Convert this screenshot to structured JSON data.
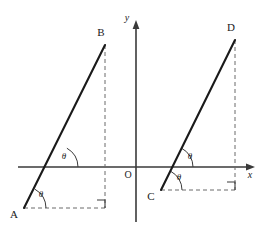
{
  "figure": {
    "kind": "geometry-diagram",
    "background_color": "#ffffff",
    "stroke_color": "#1a1a1a",
    "axis_color": "#3a3a3a",
    "dash_color": "#6b6b6b",
    "axes": {
      "x_axis_label": "x",
      "y_axis_label": "y",
      "origin_label": "O",
      "x_axis_y": 167,
      "y_axis_x": 136,
      "x_axis_start": 18,
      "x_axis_end": 255,
      "y_axis_top": 20,
      "y_axis_bottom": 222
    },
    "points": [
      {
        "label": "A",
        "x": 24,
        "y": 208,
        "label_x": 14,
        "label_y": 218
      },
      {
        "label": "B",
        "x": 105,
        "y": 45,
        "label_x": 101,
        "label_y": 36
      },
      {
        "label": "C",
        "x": 161,
        "y": 190,
        "label_x": 151,
        "label_y": 200
      },
      {
        "label": "D",
        "x": 235,
        "y": 40,
        "label_x": 231,
        "label_y": 31
      }
    ],
    "segments": [
      {
        "name": "segment-AB",
        "from": "A",
        "to": "B",
        "x1": 24,
        "y1": 208,
        "x2": 105,
        "y2": 45
      },
      {
        "name": "segment-CD",
        "from": "C",
        "to": "D",
        "x1": 161,
        "y1": 190,
        "x2": 235,
        "y2": 40
      }
    ],
    "dashed_lines": [
      {
        "name": "dashed-horizontal-A",
        "x1": 24,
        "y1": 208,
        "x2": 105,
        "y2": 208
      },
      {
        "name": "dashed-vertical-B",
        "x1": 105,
        "y1": 45,
        "x2": 105,
        "y2": 208
      },
      {
        "name": "dashed-horizontal-C",
        "x1": 161,
        "y1": 190,
        "x2": 235,
        "y2": 190
      },
      {
        "name": "dashed-vertical-D",
        "x1": 235,
        "y1": 40,
        "x2": 235,
        "y2": 190
      }
    ],
    "right_angles": [
      {
        "name": "right-angle-mark-B",
        "corner_x": 105,
        "corner_y": 208,
        "size": 8
      },
      {
        "name": "right-angle-mark-D",
        "corner_x": 235,
        "corner_y": 190,
        "size": 8
      }
    ],
    "angles": [
      {
        "name": "angle-theta-A",
        "label": "θ",
        "vertex_x": 24,
        "vertex_y": 208,
        "label_x": 41,
        "label_y": 197
      },
      {
        "name": "angle-theta-AB-axis",
        "label": "θ",
        "vertex_x": 56,
        "vertex_y": 167,
        "label_x": 64,
        "label_y": 159
      },
      {
        "name": "angle-theta-C",
        "label": "θ",
        "vertex_x": 161,
        "vertex_y": 190,
        "label_x": 179,
        "label_y": 180
      },
      {
        "name": "angle-theta-CD-axis",
        "label": "θ",
        "vertex_x": 172,
        "vertex_y": 167,
        "label_x": 190,
        "label_y": 159
      }
    ]
  }
}
